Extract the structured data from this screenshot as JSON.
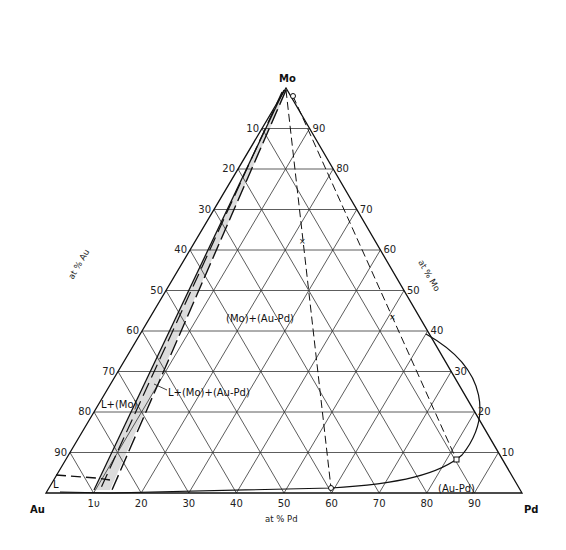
{
  "diagram": {
    "type": "ternary-phase-diagram",
    "vertices": {
      "top": "Mo",
      "left": "Au",
      "right": "Pd"
    },
    "axis_titles": {
      "left": "at % Au",
      "right": "at % Mo",
      "bottom": "at % Pd"
    },
    "ticks": {
      "bottom_pd": [
        "1υ",
        "20",
        "30",
        "40",
        "50",
        "60",
        "70",
        "80",
        "90"
      ],
      "left_au": [
        "10",
        "20",
        "30",
        "40",
        "50",
        "60",
        "70",
        "80",
        "90"
      ],
      "right_mo": [
        "90",
        "80",
        "70",
        "60",
        "50",
        "40",
        "30",
        "20",
        "10"
      ]
    },
    "regions": {
      "two_phase": "(Mo)+(Au-Pd)",
      "three_phase": "L+(Mo)+(Au-Pd)",
      "liquid_mo": "L+(Mo)",
      "liquid": "L",
      "solid_solution": "(Au-Pd)"
    },
    "colors": {
      "line": "#111111",
      "grid": "#333333",
      "band": "#d9d9d9"
    }
  }
}
